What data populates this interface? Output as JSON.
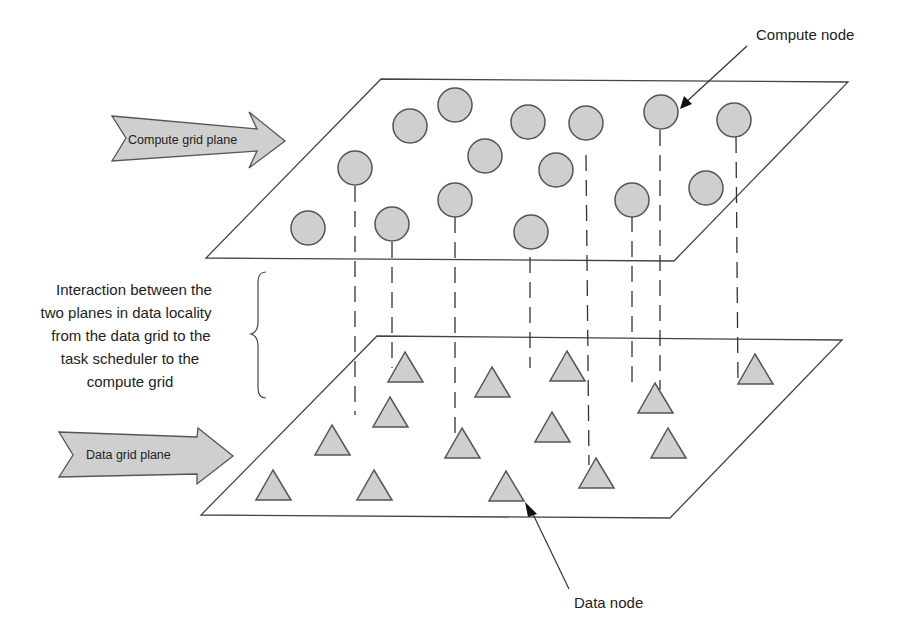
{
  "labels": {
    "compute_plane": "Compute grid plane",
    "data_plane": "Data grid plane",
    "compute_node": "Compute node",
    "data_node": "Data node",
    "interaction": [
      "Interaction between the",
      "two planes in data locality",
      "from the data grid to the",
      "task scheduler to the",
      "compute grid"
    ]
  },
  "colors": {
    "node_fill": "#cfcfcf",
    "stroke": "#444444"
  }
}
